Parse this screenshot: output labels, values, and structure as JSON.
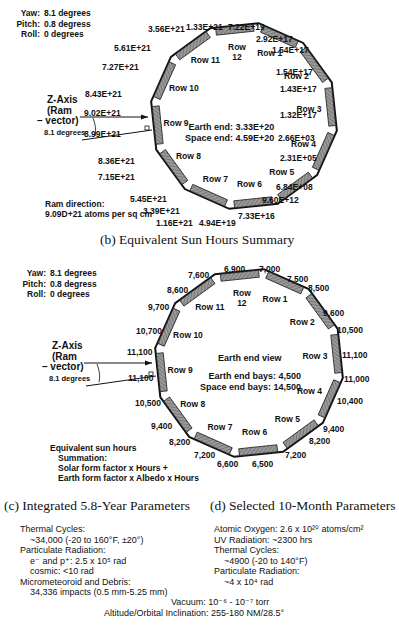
{
  "diagram_a": {
    "attitude": [
      {
        "label": "Yaw:",
        "value": "8.1 degrees"
      },
      {
        "label": "Pitch:",
        "value": "0.8 degress"
      },
      {
        "label": "Roll:",
        "value": "0    degrees"
      }
    ],
    "zaxis": {
      "line1": "Z-Axis",
      "line2": "(Ram",
      "line3": "– vector)",
      "angle": "8.1 degrees"
    },
    "center_text": {
      "earth_end": "Earth end:  3.33E+20",
      "space_end": "Space end:  4.59E+20"
    },
    "ram": {
      "line1": "Ram direction:",
      "line2": "9.09D+21 atoms per sq cm"
    },
    "rows": [
      "Row 1",
      "Row 2",
      "Row 3",
      "Row 4",
      "Row 5",
      "Row 6",
      "Row 7",
      "Row 8",
      "Row 9",
      "Row 10",
      "Row 11",
      "Row 12"
    ],
    "values": [
      {
        "text": "1.33E+21",
        "x": 186,
        "y": 22
      },
      {
        "text": "7.22E+19",
        "x": 228,
        "y": 22
      },
      {
        "text": "2.92E+17",
        "x": 256,
        "y": 34
      },
      {
        "text": "1.54E+17",
        "x": 272,
        "y": 45
      },
      {
        "text": "1.54E+17",
        "x": 276,
        "y": 67
      },
      {
        "text": "1.43E+17",
        "x": 280,
        "y": 84
      },
      {
        "text": "1.32E+17",
        "x": 280,
        "y": 110
      },
      {
        "text": "2.66E+03",
        "x": 278,
        "y": 133
      },
      {
        "text": "2.31E+05",
        "x": 280,
        "y": 153
      },
      {
        "text": "6.84E+08",
        "x": 276,
        "y": 182
      },
      {
        "text": "9.60E+12",
        "x": 262,
        "y": 195
      },
      {
        "text": "7.33E+16",
        "x": 238,
        "y": 211
      },
      {
        "text": "4.94E+19",
        "x": 199,
        "y": 218
      },
      {
        "text": "1.16E+21",
        "x": 156,
        "y": 218
      },
      {
        "text": "3.39E+21",
        "x": 143,
        "y": 206
      },
      {
        "text": "5.45E+21",
        "x": 130,
        "y": 194
      },
      {
        "text": "7.15E+21",
        "x": 98,
        "y": 172
      },
      {
        "text": "8.36E+21",
        "x": 98,
        "y": 156
      },
      {
        "text": "8.99E+21",
        "x": 84,
        "y": 129
      },
      {
        "text": "9.02E+21",
        "x": 84,
        "y": 108
      },
      {
        "text": "8.43E+21",
        "x": 85,
        "y": 89
      },
      {
        "text": "7.27E+21",
        "x": 102,
        "y": 62
      },
      {
        "text": "5.61E+21",
        "x": 114,
        "y": 43
      },
      {
        "text": "3.56E+21",
        "x": 148,
        "y": 24
      }
    ]
  },
  "title_b": "(b) Equivalent Sun Hours Summary",
  "diagram_b": {
    "attitude": [
      {
        "label": "Yaw:",
        "value": "8.1 degrees"
      },
      {
        "label": "Pitch:",
        "value": "0.8 degress"
      },
      {
        "label": "Roll:",
        "value": "0    degrees"
      }
    ],
    "zaxis": {
      "line1": "Z-Axis",
      "line2": "(Ram",
      "line3": "– vector)",
      "angle": "8.1 degrees"
    },
    "center_text": {
      "view": "Earth end view",
      "earth_end": "Earth end bays:  4,500",
      "space_end": "Space end bays:  14,500"
    },
    "summation": {
      "line1": "Equivalent sun hours",
      "line2": "Summation:",
      "line3": "Solar form factor x Hours +",
      "line4": "Earth form factor x Albedo x Hours"
    },
    "rows": [
      "Row 1",
      "Row 2",
      "Row 3",
      "Row 4",
      "Row 5",
      "Row 6",
      "Row 7",
      "Row 8",
      "Row 9",
      "Row 10",
      "Row 11",
      "Row 12"
    ],
    "values": [
      {
        "text": "6,900",
        "x": 224,
        "y": 264
      },
      {
        "text": "7,000",
        "x": 259,
        "y": 264
      },
      {
        "text": "7,500",
        "x": 287,
        "y": 274
      },
      {
        "text": "8,500",
        "x": 308,
        "y": 283
      },
      {
        "text": "9,600",
        "x": 323,
        "y": 308
      },
      {
        "text": "10,500",
        "x": 337,
        "y": 325
      },
      {
        "text": "11,100",
        "x": 342,
        "y": 350
      },
      {
        "text": "11,000",
        "x": 344,
        "y": 374
      },
      {
        "text": "10,400",
        "x": 337,
        "y": 396
      },
      {
        "text": "9,400",
        "x": 323,
        "y": 424
      },
      {
        "text": "8,200",
        "x": 309,
        "y": 436
      },
      {
        "text": "7,200",
        "x": 285,
        "y": 450
      },
      {
        "text": "6,500",
        "x": 252,
        "y": 459
      },
      {
        "text": "6,600",
        "x": 217,
        "y": 459
      },
      {
        "text": "7,200",
        "x": 194,
        "y": 450
      },
      {
        "text": "8,200",
        "x": 169,
        "y": 437
      },
      {
        "text": "9,400",
        "x": 151,
        "y": 421
      },
      {
        "text": "10,500",
        "x": 135,
        "y": 398
      },
      {
        "text": "11,100",
        "x": 128,
        "y": 373
      },
      {
        "text": "11,100",
        "x": 127,
        "y": 347
      },
      {
        "text": "10,700",
        "x": 136,
        "y": 326
      },
      {
        "text": "9,700",
        "x": 148,
        "y": 302
      },
      {
        "text": "8,600",
        "x": 167,
        "y": 285
      },
      {
        "text": "7,600",
        "x": 188,
        "y": 270
      }
    ]
  },
  "section_c": {
    "title": "(c) Integrated 5.8-Year Parameters",
    "lines": [
      {
        "text": "Thermal Cycles:",
        "indent": 0
      },
      {
        "text": "~34,000 (-20 to 160°F, ±20°)",
        "indent": 1
      },
      {
        "text": "Particulate Radiation:",
        "indent": 0
      },
      {
        "text": "e⁻ and p⁺:  2.5 x 10⁵ rad",
        "indent": 1
      },
      {
        "text": "cosmic:  <10 rad",
        "indent": 1
      },
      {
        "text": "Micrometeoroid and Debris:",
        "indent": 0
      },
      {
        "text": "34,336 impacts (0.5 mm-5.25 mm)",
        "indent": 1
      }
    ]
  },
  "section_d": {
    "title": "(d) Selected 10-Month Parameters",
    "lines": [
      {
        "text": "Atomic Oxygen:  2.6 x 10²⁰ atoms/cm²",
        "indent": 0
      },
      {
        "text": "UV Radiation:  ~2300 hrs",
        "indent": 0
      },
      {
        "text": "Thermal Cycles:",
        "indent": 0
      },
      {
        "text": "~4900 (-20 to 140°F)",
        "indent": 1
      },
      {
        "text": "Particulate Radiation:",
        "indent": 0
      },
      {
        "text": "~4 x 10⁴ rad",
        "indent": 1
      }
    ]
  },
  "shared": {
    "vacuum": "Vacuum:  10⁻⁶ - 10⁻⁷ torr",
    "altitude": "Altitude/Orbital Inclination:  255-180 NM/28.5°"
  }
}
